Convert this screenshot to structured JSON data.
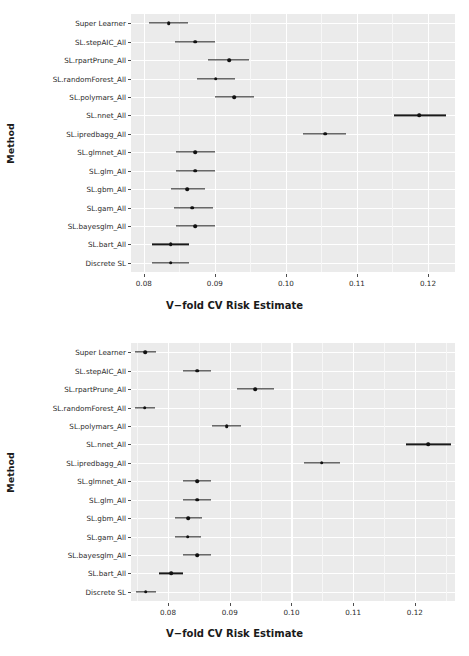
{
  "figure": {
    "panel_bg": "#ebebeb",
    "grid_color": "#ffffff",
    "point_color": "#111111"
  },
  "chart_data": [
    {
      "type": "scatter",
      "id": "top-panel",
      "title": "",
      "xlabel": "V−fold CV Risk Estimate",
      "ylabel": "Method",
      "grid": true,
      "legend": "none",
      "xlim": [
        0.0782,
        0.1238
      ],
      "xticks": [
        0.08,
        0.09,
        0.1,
        0.11,
        0.12
      ],
      "xticklabels": [
        "0.08",
        "0.09",
        "0.10",
        "0.11",
        "0.12"
      ],
      "categories": [
        "Super Learner",
        "SL.stepAIC_All",
        "SL.rpartPrune_All",
        "SL.randomForest_All",
        "SL.polymars_All",
        "SL.nnet_All",
        "SL.ipredbagg_All",
        "SL.glmnet_All",
        "SL.glm_All",
        "SL.gbm_All",
        "SL.gam_All",
        "SL.bayesglm_All",
        "SL.bart_All",
        "Discrete SL"
      ],
      "values": [
        0.0835,
        0.0872,
        0.092,
        0.0901,
        0.0927,
        0.1188,
        0.1055,
        0.0872,
        0.0872,
        0.0861,
        0.0868,
        0.0872,
        0.0838,
        0.0838
      ],
      "ci_lower": [
        0.0807,
        0.0844,
        0.089,
        0.0875,
        0.09,
        0.1152,
        0.1024,
        0.0845,
        0.0845,
        0.0838,
        0.0843,
        0.0845,
        0.0811,
        0.0811
      ],
      "ci_upper": [
        0.0862,
        0.09,
        0.0948,
        0.0928,
        0.0955,
        0.1225,
        0.1084,
        0.09,
        0.09,
        0.0886,
        0.0898,
        0.09,
        0.0864,
        0.0864
      ]
    },
    {
      "type": "scatter",
      "id": "bottom-panel",
      "title": "",
      "xlabel": "V−fold CV Risk Estimate",
      "ylabel": "Method",
      "grid": true,
      "legend": "none",
      "xlim": [
        0.074,
        0.1265
      ],
      "xticks": [
        0.08,
        0.09,
        0.1,
        0.11,
        0.12
      ],
      "xticklabels": [
        "0.08",
        "0.09",
        "0.10",
        "0.11",
        "0.12"
      ],
      "categories": [
        "Super Learner",
        "SL.stepAIC_All",
        "SL.rpartPrune_All",
        "SL.randomForest_All",
        "SL.polymars_All",
        "SL.nnet_All",
        "SL.ipredbagg_All",
        "SL.glmnet_All",
        "SL.glm_All",
        "SL.gbm_All",
        "SL.gam_All",
        "SL.bayesglm_All",
        "SL.bart_All",
        "Discrete SL"
      ],
      "values": [
        0.0763,
        0.0847,
        0.0941,
        0.0762,
        0.0895,
        0.1222,
        0.1049,
        0.0847,
        0.0847,
        0.0833,
        0.0832,
        0.0847,
        0.0805,
        0.0764
      ],
      "ci_lower": [
        0.0747,
        0.0825,
        0.0911,
        0.0746,
        0.0872,
        0.1186,
        0.102,
        0.0825,
        0.0825,
        0.0812,
        0.0811,
        0.0825,
        0.0786,
        0.0748
      ],
      "ci_upper": [
        0.078,
        0.087,
        0.0971,
        0.0779,
        0.0918,
        0.1259,
        0.1079,
        0.087,
        0.087,
        0.0855,
        0.0854,
        0.087,
        0.0824,
        0.0781
      ]
    }
  ]
}
